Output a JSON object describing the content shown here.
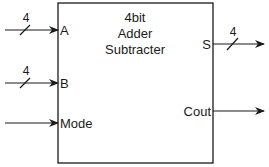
{
  "block": {
    "title_lines": [
      "4bit",
      "Adder",
      "Subtracter"
    ]
  },
  "inputs": [
    {
      "name": "A",
      "bus_width": "4"
    },
    {
      "name": "B",
      "bus_width": "4"
    },
    {
      "name": "Mode",
      "bus_width": ""
    }
  ],
  "outputs": [
    {
      "name": "S",
      "bus_width": "4"
    },
    {
      "name": "Cout",
      "bus_width": ""
    }
  ],
  "colors": {
    "line": "#1a1a1a",
    "background": "#ffffff"
  }
}
